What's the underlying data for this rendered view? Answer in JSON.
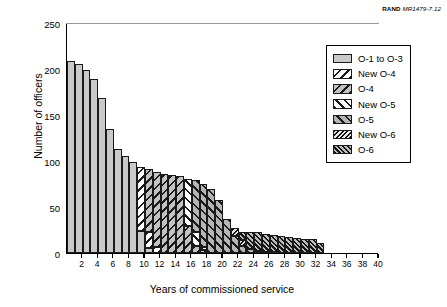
{
  "credit": {
    "organization": "RAND",
    "document_id": "MR1479-7.12"
  },
  "chart_data": {
    "type": "bar",
    "stacked": true,
    "title": "",
    "xlabel": "Years of commissioned service",
    "ylabel": "Number of officers",
    "xlim": [
      0,
      40
    ],
    "ylim": [
      0,
      250
    ],
    "yticks": [
      0,
      50,
      100,
      150,
      200,
      250
    ],
    "xticks": [
      2,
      4,
      6,
      8,
      10,
      12,
      14,
      16,
      18,
      20,
      22,
      24,
      26,
      28,
      30,
      32,
      34,
      36,
      38,
      40
    ],
    "grid": false,
    "legend_position": "upper-right",
    "categories": [
      1,
      2,
      3,
      4,
      5,
      6,
      7,
      8,
      9,
      10,
      11,
      12,
      13,
      14,
      15,
      16,
      17,
      18,
      19,
      20,
      21,
      22,
      23,
      24,
      25,
      26,
      27,
      28,
      29,
      30,
      31,
      32,
      33,
      34,
      35,
      36,
      37,
      38,
      39,
      40
    ],
    "series": [
      {
        "name": "O-1 to O-3",
        "pattern": "solid-gray",
        "color": "#c9c9c9",
        "values": [
          209,
          205,
          199,
          189,
          168,
          135,
          113,
          105,
          99,
          24,
          5,
          0,
          0,
          0,
          0,
          0,
          0,
          0,
          0,
          0,
          0,
          0,
          0,
          0,
          0,
          0,
          0,
          0,
          0,
          0,
          0,
          0,
          0,
          0,
          0,
          0,
          0,
          0,
          0,
          0
        ]
      },
      {
        "name": "New O-4",
        "pattern": "white-backslash",
        "color": "#ffffff",
        "values": [
          0,
          0,
          0,
          0,
          0,
          0,
          0,
          0,
          0,
          70,
          18,
          6,
          0,
          0,
          0,
          0,
          0,
          0,
          0,
          0,
          0,
          0,
          0,
          0,
          0,
          0,
          0,
          0,
          0,
          0,
          0,
          0,
          0,
          0,
          0,
          0,
          0,
          0,
          0,
          0
        ]
      },
      {
        "name": "O-4",
        "pattern": "gray-backslash",
        "color": "#c2c2c2",
        "values": [
          0,
          0,
          0,
          0,
          0,
          0,
          0,
          0,
          0,
          0,
          68,
          82,
          86,
          85,
          84,
          29,
          8,
          3,
          0,
          0,
          0,
          0,
          0,
          0,
          0,
          0,
          0,
          0,
          0,
          0,
          0,
          0,
          0,
          0,
          0,
          0,
          0,
          0,
          0,
          0
        ]
      },
      {
        "name": "New O-5",
        "pattern": "white-forwardslash",
        "color": "#ffffff",
        "values": [
          0,
          0,
          0,
          0,
          0,
          0,
          0,
          0,
          0,
          0,
          0,
          0,
          0,
          0,
          0,
          52,
          15,
          4,
          0,
          0,
          0,
          0,
          0,
          0,
          0,
          0,
          0,
          0,
          0,
          0,
          0,
          0,
          0,
          0,
          0,
          0,
          0,
          0,
          0,
          0
        ]
      },
      {
        "name": "O-5",
        "pattern": "gray-forwardslash",
        "color": "#b5b5b5",
        "values": [
          0,
          0,
          0,
          0,
          0,
          0,
          0,
          0,
          0,
          0,
          0,
          0,
          0,
          0,
          0,
          0,
          56,
          68,
          70,
          58,
          37,
          19,
          8,
          4,
          2,
          1,
          1,
          0,
          0,
          0,
          0,
          0,
          0,
          0,
          0,
          0,
          0,
          0,
          0,
          0
        ]
      },
      {
        "name": "New O-6",
        "pattern": "dark-dense-backslash",
        "color": "#1a1a1a",
        "values": [
          0,
          0,
          0,
          0,
          0,
          0,
          0,
          0,
          0,
          0,
          0,
          0,
          0,
          0,
          0,
          0,
          0,
          0,
          0,
          0,
          0,
          8,
          6,
          0,
          0,
          0,
          0,
          0,
          0,
          0,
          0,
          0,
          0,
          0,
          0,
          0,
          0,
          0,
          0,
          0
        ]
      },
      {
        "name": "O-6",
        "pattern": "gray-dense-forwardslash",
        "color": "#bdbdbd",
        "values": [
          0,
          0,
          0,
          0,
          0,
          0,
          0,
          0,
          0,
          0,
          0,
          0,
          0,
          0,
          0,
          0,
          0,
          0,
          0,
          0,
          0,
          0,
          9,
          19,
          21,
          20,
          19,
          18,
          17,
          16,
          15,
          15,
          11,
          0,
          0,
          0,
          0,
          0,
          0,
          0
        ]
      }
    ],
    "totals": [
      209,
      205,
      199,
      189,
      168,
      135,
      113,
      105,
      99,
      94,
      91,
      88,
      86,
      85,
      84,
      81,
      79,
      75,
      70,
      58,
      37,
      27,
      23,
      23,
      23,
      21,
      20,
      18,
      17,
      16,
      15,
      15,
      11,
      0,
      0,
      0,
      0,
      0,
      0,
      0
    ]
  },
  "legend": {
    "items": [
      {
        "label": "O-1 to O-3",
        "pattern_class": "p-o13"
      },
      {
        "label": "New O-4",
        "pattern_class": "p-newo4"
      },
      {
        "label": "O-4",
        "pattern_class": "p-o4"
      },
      {
        "label": "New O-5",
        "pattern_class": "p-newo5"
      },
      {
        "label": "O-5",
        "pattern_class": "p-o5"
      },
      {
        "label": "New O-6",
        "pattern_class": "p-newo6"
      },
      {
        "label": "O-6",
        "pattern_class": "p-o6"
      }
    ]
  }
}
